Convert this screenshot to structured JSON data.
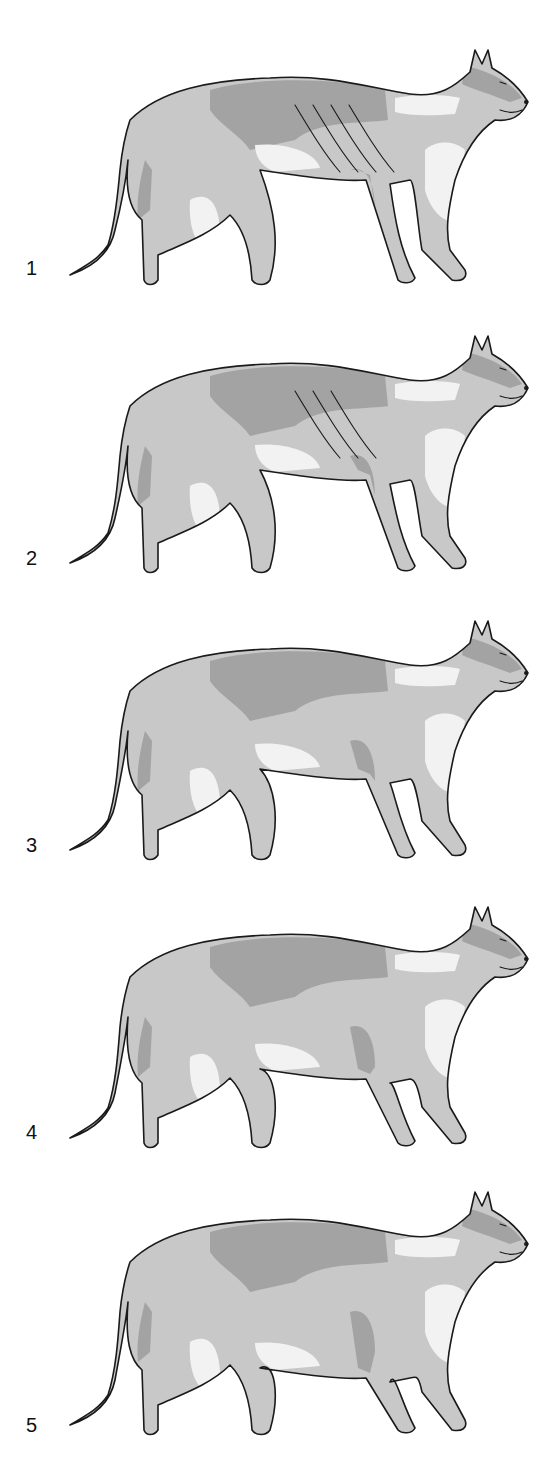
{
  "figure": {
    "colors": {
      "base": "#c8c8c8",
      "dark": "#a3a3a3",
      "light": "#f2f2f2",
      "outline": "#1a1a1a"
    },
    "panels": [
      {
        "label": "1",
        "girth": 0,
        "ribs": 4
      },
      {
        "label": "2",
        "girth": 1,
        "ribs": 3
      },
      {
        "label": "3",
        "girth": 2,
        "ribs": 0
      },
      {
        "label": "4",
        "girth": 3,
        "ribs": 0
      },
      {
        "label": "5",
        "girth": 4,
        "ribs": 0
      }
    ]
  }
}
